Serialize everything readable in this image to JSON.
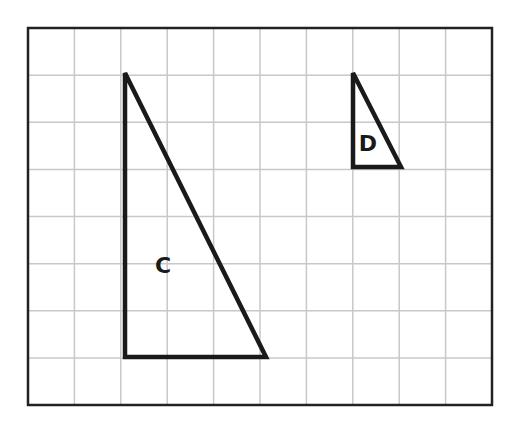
{
  "figure": {
    "grid": {
      "columns": 10,
      "rows": 8,
      "frame": {
        "x": 28,
        "y": 28,
        "width": 464,
        "height": 377
      },
      "line_color": "#c8c8c8",
      "frame_color": "#222222"
    },
    "shapes": [
      {
        "label": "C",
        "type": "right-triangle",
        "points": [
          [
            125,
            73
          ],
          [
            125,
            357
          ],
          [
            266,
            357
          ]
        ],
        "label_pos": [
          163,
          273
        ],
        "grid_size": {
          "base": 3,
          "height": 6
        }
      },
      {
        "label": "D",
        "type": "right-triangle",
        "points": [
          [
            353,
            73
          ],
          [
            353,
            167
          ],
          [
            401,
            167
          ]
        ],
        "label_pos": [
          368,
          151
        ],
        "grid_size": {
          "base": 1,
          "height": 2
        }
      }
    ],
    "stroke_color": "#1a1a1a"
  }
}
